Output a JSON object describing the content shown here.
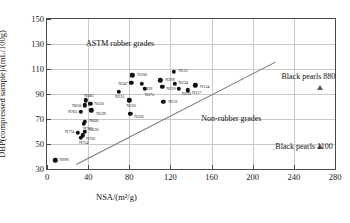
{
  "chart_data": {
    "type": "scatter",
    "title": "",
    "xlabel": "NSA/(m²/g)",
    "ylabel": "DBP(compressed sample)/(mL/100g)",
    "xlim": [
      0,
      280
    ],
    "ylim": [
      30,
      150
    ],
    "xticks": [
      0,
      40,
      80,
      120,
      160,
      200,
      240,
      280
    ],
    "yticks": [
      30,
      50,
      70,
      90,
      110,
      130,
      150
    ],
    "grid": true,
    "legend": "none",
    "annotations": [
      {
        "text": "ASTM rubber grades",
        "x": 38,
        "y": 130
      },
      {
        "text": "Non-rubber grades",
        "x": 150,
        "y": 70
      },
      {
        "text": "Black pearls 880",
        "x": 228,
        "y": 104
      },
      {
        "text": "Black pearls 1100",
        "x": 222,
        "y": 48
      }
    ],
    "divider": {
      "x0": 28,
      "y0": 34,
      "x1": 222,
      "y1": 116
    },
    "series": [
      {
        "name": "ASTM rubber grades",
        "marker": "circle",
        "points": [
          {
            "label": "N990",
            "x": 8,
            "y": 37
          },
          {
            "label": "N774",
            "x": 30,
            "y": 59
          },
          {
            "label": "N630",
            "x": 37,
            "y": 60
          },
          {
            "label": "N762",
            "x": 35,
            "y": 57
          },
          {
            "label": "N754",
            "x": 33,
            "y": 55
          },
          {
            "label": "N660",
            "x": 37,
            "y": 68
          },
          {
            "label": "N787",
            "x": 36,
            "y": 66
          },
          {
            "label": "N765",
            "x": 33,
            "y": 76
          },
          {
            "label": "N683",
            "x": 38,
            "y": 85
          },
          {
            "label": "N650",
            "x": 37,
            "y": 81
          },
          {
            "label": "N550",
            "x": 42,
            "y": 82
          },
          {
            "label": "N539",
            "x": 43,
            "y": 77
          },
          {
            "label": "N351",
            "x": 70,
            "y": 92
          },
          {
            "label": "N330",
            "x": 80,
            "y": 85
          },
          {
            "label": "N347",
            "x": 82,
            "y": 99
          },
          {
            "label": "N358",
            "x": 83,
            "y": 105
          },
          {
            "label": "N339",
            "x": 92,
            "y": 98
          },
          {
            "label": "N375",
            "x": 95,
            "y": 94
          },
          {
            "label": "N326",
            "x": 81,
            "y": 74
          },
          {
            "label": "N220",
            "x": 112,
            "y": 96
          },
          {
            "label": "N299",
            "x": 110,
            "y": 101
          },
          {
            "label": "N231",
            "x": 113,
            "y": 84
          },
          {
            "label": "N121",
            "x": 123,
            "y": 108
          },
          {
            "label": "N234",
            "x": 124,
            "y": 98
          },
          {
            "label": "N110",
            "x": 128,
            "y": 94
          },
          {
            "label": "N117",
            "x": 137,
            "y": 93
          },
          {
            "label": "N134",
            "x": 144,
            "y": 97
          }
        ]
      },
      {
        "name": "Black pearls",
        "marker": "triangle",
        "points": [
          {
            "label": "Black pearls 880",
            "x": 265,
            "y": 95
          },
          {
            "label": "Black pearls 1100",
            "x": 265,
            "y": 48
          }
        ]
      }
    ]
  }
}
